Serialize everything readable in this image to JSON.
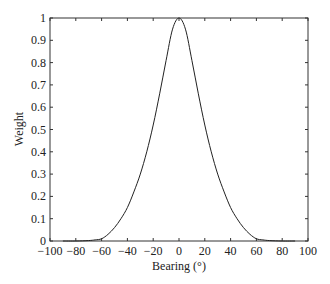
{
  "chart_data": {
    "type": "line",
    "title": "",
    "xlabel": "Bearing (°)",
    "ylabel": "Weight",
    "xlim": [
      -100,
      100
    ],
    "ylim": [
      0,
      1
    ],
    "xticks": [
      -100,
      -80,
      -60,
      -40,
      -20,
      0,
      20,
      40,
      60,
      80,
      100
    ],
    "yticks": [
      0,
      0.1,
      0.2,
      0.3,
      0.4,
      0.5,
      0.6,
      0.7,
      0.8,
      0.9,
      1
    ],
    "ytick_labels": [
      "0",
      "0.1",
      "0.2",
      "0.3",
      "0.4",
      "0.5",
      "0.6",
      "0.7",
      "0.8",
      "0.9",
      "1"
    ],
    "grid": false,
    "legend": null,
    "series": [
      {
        "name": "Weight",
        "color": "#222222",
        "x": [
          -90,
          -80,
          -70,
          -65,
          -60,
          -55,
          -50,
          -45,
          -40,
          -35,
          -30,
          -25,
          -20,
          -15,
          -10,
          -5,
          0,
          5,
          10,
          15,
          20,
          25,
          30,
          35,
          40,
          45,
          50,
          55,
          60,
          65,
          70,
          80,
          90
        ],
        "y": [
          0.0,
          0.0,
          0.002,
          0.005,
          0.01,
          0.03,
          0.06,
          0.1,
          0.15,
          0.22,
          0.3,
          0.4,
          0.52,
          0.66,
          0.81,
          0.95,
          1.0,
          0.95,
          0.81,
          0.66,
          0.52,
          0.4,
          0.3,
          0.22,
          0.15,
          0.1,
          0.06,
          0.03,
          0.01,
          0.005,
          0.002,
          0.0,
          0.0
        ]
      }
    ]
  }
}
